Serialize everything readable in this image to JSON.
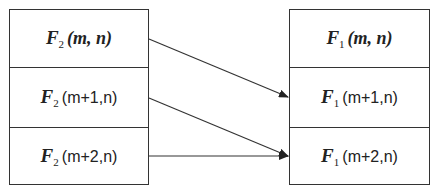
{
  "left_box": {
    "cells": [
      {
        "func": "F",
        "sub": "2",
        "args": "(m, n)",
        "italic_args": true
      },
      {
        "func": "F",
        "sub": "2",
        "args": "(m+1,n)",
        "italic_args": false
      },
      {
        "func": "F",
        "sub": "2",
        "args": "(m+2,n)",
        "italic_args": false
      }
    ]
  },
  "right_box": {
    "cells": [
      {
        "func": "F",
        "sub": "1",
        "args": "(m, n)",
        "italic_args": true
      },
      {
        "func": "F",
        "sub": "1",
        "args": "(m+1,n)",
        "italic_args": false
      },
      {
        "func": "F",
        "sub": "1",
        "args": "(m+2,n)",
        "italic_args": false
      }
    ]
  },
  "arrows": [
    {
      "from": "F2(m,n)",
      "to": "F1(m+1,n)"
    },
    {
      "from": "F2(m+1,n)",
      "to": "F1(m+2,n)"
    },
    {
      "from": "F2(m+2,n)",
      "to": "F1(m+2,n)"
    }
  ]
}
